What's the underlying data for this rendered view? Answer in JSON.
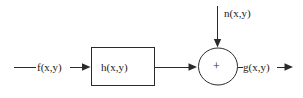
{
  "diagram": {
    "colors": {
      "stroke": "#2b2b2b",
      "text": "#1c1c1c",
      "background": "#ffffff"
    },
    "labels": {
      "input_signal": "f(x,y)",
      "system_block": "h(x,y)",
      "noise_signal": "n(x,y)",
      "output_signal": "g(x,y)",
      "sum_operator": "+"
    },
    "nodes": [
      {
        "id": "system-block",
        "type": "rectangle",
        "label": "h(x,y)",
        "x": 91,
        "y": 47,
        "width": 64,
        "height": 39
      },
      {
        "id": "summing-junction",
        "type": "circle",
        "label": "+",
        "cx": 218,
        "cy": 66,
        "rx": 20,
        "ry": 19
      }
    ],
    "edges": [
      {
        "id": "input-edge",
        "from": "input-source",
        "to": "system-block",
        "label": "f(x,y)",
        "direction": "right"
      },
      {
        "id": "system-to-sum-edge",
        "from": "system-block",
        "to": "summing-junction",
        "label": "",
        "direction": "right"
      },
      {
        "id": "noise-edge",
        "from": "noise-source",
        "to": "summing-junction",
        "label": "n(x,y)",
        "direction": "down"
      },
      {
        "id": "output-edge",
        "from": "summing-junction",
        "to": "output-sink",
        "label": "g(x,y)",
        "direction": "right"
      }
    ]
  }
}
